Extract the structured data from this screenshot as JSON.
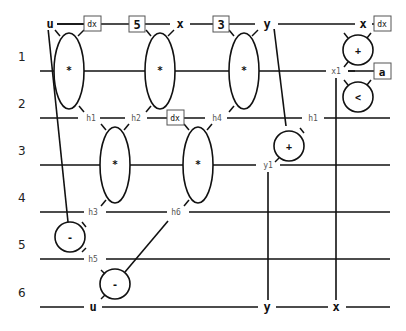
{
  "diagram": {
    "type": "dataflow-wire-diagram",
    "row_labels": [
      "1",
      "2",
      "3",
      "4",
      "5",
      "6"
    ],
    "top_wire_labels": {
      "u": "u",
      "x": "x",
      "y": "y",
      "x_right": "x"
    },
    "bottom_wire_labels": {
      "u": "u",
      "y": "y",
      "x": "x"
    },
    "boxes": {
      "dx_top_left": "dx",
      "const_5": "5",
      "const_3": "3",
      "dx_top_right": "dx",
      "a": "a",
      "dx_row2": "dx"
    },
    "wire_labels": {
      "x1": "x1",
      "h1_left": "h1",
      "h2": "h2",
      "h4": "h4",
      "h1_right": "h1",
      "y1": "y1",
      "h3": "h3",
      "h6": "h6",
      "h5": "h5"
    },
    "nodes": {
      "mul1": "*",
      "mul2": "*",
      "mul3": "*",
      "add1": "+",
      "lt": "<",
      "mul4": "*",
      "mul5": "*",
      "add2": "+",
      "sub1": "-",
      "sub2": "-"
    }
  }
}
